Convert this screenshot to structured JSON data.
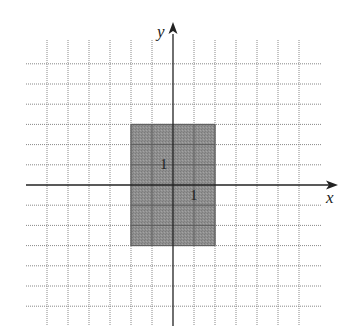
{
  "diagram": {
    "type": "coordinate-grid-with-shaded-rectangle",
    "axes": {
      "x_label": "x",
      "y_label": "y"
    },
    "grid": {
      "x_units": [
        -7,
        6
      ],
      "y_units": [
        -6,
        6
      ],
      "line_color": "#888888",
      "axis_color": "#222222"
    },
    "rectangle": {
      "x_min": -2,
      "x_max": 2,
      "y_min": -3,
      "y_max": 3,
      "fill_color": "#8c8c8c",
      "border_color": "#6a6a6a"
    },
    "labels": [
      {
        "text": "1",
        "meaning": "y-unit",
        "unit_x": -0.45,
        "unit_y": 1
      },
      {
        "text": "1",
        "meaning": "x-unit",
        "unit_x": 1,
        "unit_y": -0.55
      }
    ]
  }
}
